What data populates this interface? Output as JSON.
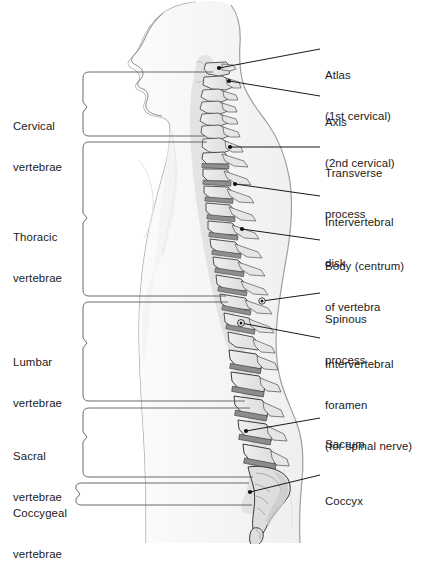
{
  "figure": {
    "type": "anatomical-diagram",
    "background_color": "#ffffff",
    "line_color": "#1a1a1a",
    "bone_fill": "#e8e8e8",
    "disk_fill": "#9a9a9a",
    "body_fill": "#f2f2f2"
  },
  "region_labels": [
    {
      "id": "cervical",
      "line1": "Cervical",
      "line2": "vertebrae"
    },
    {
      "id": "thoracic",
      "line1": "Thoracic",
      "line2": "vertebrae"
    },
    {
      "id": "lumbar",
      "line1": "Lumbar",
      "line2": "vertebrae"
    },
    {
      "id": "sacral",
      "line1": "Sacral",
      "line2": "vertebrae"
    },
    {
      "id": "coccygeal",
      "line1": "Coccygeal",
      "line2": "vertebrae"
    }
  ],
  "part_labels": [
    {
      "id": "atlas",
      "line1": "Atlas",
      "line2": "(1st cervical)",
      "line3": ""
    },
    {
      "id": "axis",
      "line1": "Axis",
      "line2": "(2nd cervical)",
      "line3": ""
    },
    {
      "id": "transverse-process",
      "line1": "Transverse",
      "line2": "process",
      "line3": ""
    },
    {
      "id": "intervertebral-disk",
      "line1": "Intervertebral",
      "line2": "disk",
      "line3": ""
    },
    {
      "id": "body-centrum",
      "line1": "Body (centrum)",
      "line2": "of vertebra",
      "line3": ""
    },
    {
      "id": "spinous-process",
      "line1": "Spinous",
      "line2": "process",
      "line3": ""
    },
    {
      "id": "intervertebral-foramen",
      "line1": "Intervertebral",
      "line2": "foramen",
      "line3": "(for spinal nerve)"
    },
    {
      "id": "sacrum",
      "line1": "Sacrum",
      "line2": "",
      "line3": ""
    },
    {
      "id": "coccyx",
      "line1": "Coccyx",
      "line2": "",
      "line3": ""
    }
  ]
}
